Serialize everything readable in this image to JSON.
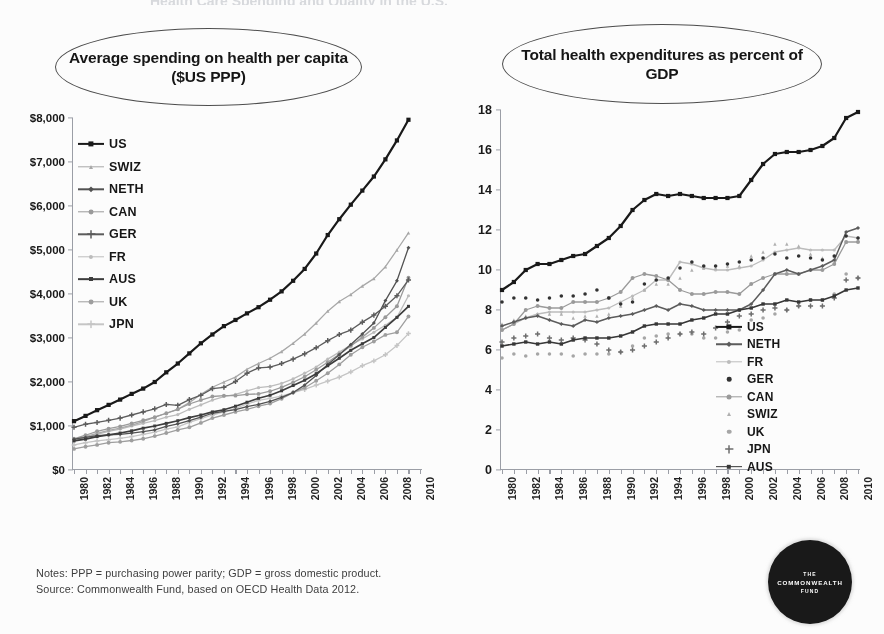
{
  "cropped_title": "Health Care Spending and Quality in the U.S.",
  "footer": {
    "notes": "Notes: PPP = purchasing power parity; GDP = gross domestic product.",
    "source": "Source: Commonwealth Fund, based on OECD Health Data 2012."
  },
  "logo": {
    "line1": "THE",
    "line2": "COMMONWEALTH",
    "line3": "FUND"
  },
  "chart_data": [
    {
      "id": "spending_per_capita",
      "type": "line",
      "title": "Average spending on health per capita ($US PPP)",
      "xlabel": "",
      "ylabel": "",
      "xlim": [
        1980,
        2010
      ],
      "ylim": [
        0,
        8000
      ],
      "yticks": [
        "$0",
        "$1,000",
        "$2,000",
        "$3,000",
        "$4,000",
        "$5,000",
        "$6,000",
        "$7,000",
        "$8,000"
      ],
      "ytick_values": [
        0,
        1000,
        2000,
        3000,
        4000,
        5000,
        6000,
        7000,
        8000
      ],
      "x": [
        1980,
        1981,
        1982,
        1983,
        1984,
        1985,
        1986,
        1987,
        1988,
        1989,
        1990,
        1991,
        1992,
        1993,
        1994,
        1995,
        1996,
        1997,
        1998,
        1999,
        2000,
        2001,
        2002,
        2003,
        2004,
        2005,
        2006,
        2007,
        2008,
        2009
      ],
      "xtick_labels": [
        "1980",
        "1982",
        "1984",
        "1986",
        "1988",
        "1990",
        "1992",
        "1994",
        "1996",
        "1998",
        "2000",
        "2002",
        "2004",
        "2006",
        "2008",
        "2010"
      ],
      "grid": false,
      "legend_position": "upper-left-inside",
      "series": [
        {
          "name": "US",
          "color": "#141414",
          "marker": "square",
          "size": 4.2,
          "width": 2.2,
          "values": [
            1110,
            1230,
            1360,
            1480,
            1600,
            1730,
            1850,
            2000,
            2220,
            2420,
            2650,
            2880,
            3080,
            3270,
            3410,
            3560,
            3700,
            3870,
            4060,
            4300,
            4570,
            4920,
            5340,
            5700,
            6030,
            6350,
            6670,
            7060,
            7490,
            7960
          ]
        },
        {
          "name": "SWIZ",
          "color": "#a8a8a8",
          "marker": "triangle",
          "size": 3.6,
          "width": 1.3,
          "values": [
            700,
            760,
            830,
            900,
            950,
            1020,
            1100,
            1200,
            1290,
            1380,
            1530,
            1720,
            1880,
            2000,
            2110,
            2290,
            2420,
            2540,
            2690,
            2880,
            3090,
            3340,
            3610,
            3830,
            3990,
            4180,
            4350,
            4620,
            5000,
            5390
          ]
        },
        {
          "name": "NETH",
          "color": "#4f4f4f",
          "marker": "diamond",
          "size": 3.4,
          "width": 1.3,
          "values": [
            700,
            740,
            780,
            800,
            810,
            840,
            870,
            910,
            990,
            1050,
            1120,
            1200,
            1290,
            1330,
            1370,
            1440,
            1490,
            1560,
            1650,
            1760,
            1930,
            2150,
            2400,
            2620,
            2850,
            3090,
            3340,
            3850,
            4300,
            5050
          ]
        },
        {
          "name": "CAN",
          "color": "#9a9a9a",
          "marker": "circle",
          "size": 3.9,
          "width": 1.3,
          "values": [
            710,
            790,
            880,
            940,
            990,
            1060,
            1130,
            1200,
            1290,
            1380,
            1500,
            1590,
            1670,
            1690,
            1690,
            1720,
            1730,
            1790,
            1880,
            1990,
            2120,
            2280,
            2450,
            2630,
            2820,
            3020,
            3230,
            3470,
            3720,
            4370
          ]
        },
        {
          "name": "GER",
          "color": "#5a5a5a",
          "marker": "cross",
          "size": 3.4,
          "width": 1.3,
          "values": [
            970,
            1040,
            1080,
            1130,
            1180,
            1250,
            1320,
            1390,
            1490,
            1470,
            1600,
            1700,
            1850,
            1880,
            2010,
            2200,
            2320,
            2340,
            2420,
            2520,
            2640,
            2780,
            2940,
            3080,
            3180,
            3360,
            3520,
            3720,
            3960,
            4320
          ]
        },
        {
          "name": "FR",
          "color": "#bdbdbd",
          "marker": "dot",
          "size": 3.2,
          "width": 1.3,
          "values": [
            670,
            740,
            810,
            880,
            930,
            1000,
            1060,
            1120,
            1200,
            1260,
            1380,
            1480,
            1590,
            1670,
            1720,
            1800,
            1870,
            1900,
            1970,
            2070,
            2200,
            2340,
            2520,
            2680,
            2840,
            2980,
            3130,
            3290,
            3470,
            3960
          ]
        },
        {
          "name": "AUS",
          "color": "#3a3a3a",
          "marker": "square",
          "size": 3.0,
          "width": 1.7,
          "values": [
            660,
            700,
            760,
            800,
            840,
            890,
            950,
            1000,
            1060,
            1120,
            1190,
            1250,
            1320,
            1370,
            1450,
            1540,
            1630,
            1700,
            1800,
            1920,
            2040,
            2190,
            2370,
            2540,
            2720,
            2870,
            3010,
            3240,
            3470,
            3720
          ]
        },
        {
          "name": "UK",
          "color": "#9e9e9e",
          "marker": "circle",
          "size": 3.9,
          "width": 1.3,
          "values": [
            480,
            530,
            570,
            620,
            640,
            670,
            710,
            770,
            840,
            910,
            970,
            1070,
            1180,
            1250,
            1320,
            1380,
            1450,
            1510,
            1620,
            1760,
            1870,
            2030,
            2200,
            2400,
            2620,
            2790,
            2920,
            3070,
            3130,
            3490
          ]
        },
        {
          "name": "JPN",
          "color": "#c6c6c6",
          "marker": "plus",
          "size": 3.2,
          "width": 1.3,
          "values": [
            570,
            620,
            660,
            690,
            720,
            760,
            810,
            860,
            930,
            980,
            1080,
            1170,
            1250,
            1320,
            1400,
            1500,
            1580,
            1630,
            1680,
            1760,
            1830,
            1930,
            2020,
            2110,
            2230,
            2370,
            2480,
            2620,
            2830,
            3100
          ]
        }
      ]
    },
    {
      "id": "expenditures_pct_gdp",
      "type": "line",
      "title": "Total health expenditures as percent of GDP",
      "xlabel": "",
      "ylabel": "",
      "xlim": [
        1980,
        2010
      ],
      "ylim": [
        0,
        18
      ],
      "yticks": [
        "0",
        "2",
        "4",
        "6",
        "8",
        "10",
        "12",
        "14",
        "16",
        "18"
      ],
      "ytick_values": [
        0,
        2,
        4,
        6,
        8,
        10,
        12,
        14,
        16,
        18
      ],
      "x": [
        1980,
        1981,
        1982,
        1983,
        1984,
        1985,
        1986,
        1987,
        1988,
        1989,
        1990,
        1991,
        1992,
        1993,
        1994,
        1995,
        1996,
        1997,
        1998,
        1999,
        2000,
        2001,
        2002,
        2003,
        2004,
        2005,
        2006,
        2007,
        2008,
        2009,
        2010
      ],
      "xtick_labels": [
        "1980",
        "1982",
        "1984",
        "1986",
        "1988",
        "1990",
        "1992",
        "1994",
        "1996",
        "1998",
        "2000",
        "2002",
        "2004",
        "2006",
        "2008",
        "2010"
      ],
      "grid": false,
      "legend_position": "lower-right-inside",
      "series": [
        {
          "name": "US",
          "color": "#141414",
          "marker": "square",
          "size": 4.2,
          "width": 2.2,
          "values": [
            9.0,
            9.4,
            10.0,
            10.3,
            10.3,
            10.5,
            10.7,
            10.8,
            11.2,
            11.6,
            12.2,
            13.0,
            13.5,
            13.8,
            13.7,
            13.8,
            13.7,
            13.6,
            13.6,
            13.6,
            13.7,
            14.5,
            15.3,
            15.8,
            15.9,
            15.9,
            16.0,
            16.2,
            16.6,
            17.6,
            17.9
          ]
        },
        {
          "name": "NETH",
          "color": "#5a5a5a",
          "marker": "diamond",
          "size": 3.6,
          "width": 1.5,
          "values": [
            7.2,
            7.4,
            7.6,
            7.7,
            7.5,
            7.3,
            7.2,
            7.5,
            7.4,
            7.6,
            7.7,
            7.8,
            8.0,
            8.2,
            8.0,
            8.3,
            8.2,
            8.0,
            8.0,
            8.0,
            8.0,
            8.3,
            9.0,
            9.8,
            10.0,
            9.8,
            10.0,
            10.2,
            10.5,
            11.9,
            12.1
          ]
        },
        {
          "name": "FR",
          "color": "#bdbdbd",
          "marker": "dot",
          "size": 3.2,
          "width": 1.4,
          "values": [
            7.0,
            7.3,
            7.6,
            7.8,
            7.9,
            7.9,
            7.9,
            7.9,
            8.0,
            8.1,
            8.4,
            8.7,
            9.0,
            9.5,
            9.5,
            10.4,
            10.3,
            10.1,
            10.0,
            10.0,
            10.1,
            10.2,
            10.5,
            10.9,
            11.0,
            11.1,
            11.0,
            11.0,
            11.0,
            11.7,
            11.6
          ]
        },
        {
          "name": "GER",
          "color": "#2e2e2e",
          "marker": "dot",
          "size": 3.6,
          "width": 0,
          "values": [
            8.4,
            8.6,
            8.6,
            8.5,
            8.6,
            8.7,
            8.7,
            8.8,
            9.0,
            8.6,
            8.3,
            8.4,
            9.3,
            9.5,
            9.6,
            10.1,
            10.4,
            10.2,
            10.2,
            10.3,
            10.4,
            10.5,
            10.6,
            10.8,
            10.6,
            10.7,
            10.6,
            10.5,
            10.7,
            11.7,
            11.6
          ]
        },
        {
          "name": "CAN",
          "color": "#9a9a9a",
          "marker": "circle",
          "size": 4.0,
          "width": 1.3,
          "values": [
            7.0,
            7.3,
            8.0,
            8.2,
            8.1,
            8.1,
            8.4,
            8.4,
            8.4,
            8.6,
            8.9,
            9.6,
            9.8,
            9.7,
            9.5,
            9.0,
            8.8,
            8.8,
            8.9,
            8.9,
            8.8,
            9.3,
            9.6,
            9.8,
            9.8,
            9.8,
            10.0,
            10.0,
            10.3,
            11.4,
            11.4
          ]
        },
        {
          "name": "SWIZ",
          "color": "#b0b0b0",
          "marker": "triangle",
          "size": 3.6,
          "width": 0,
          "values": [
            7.3,
            7.5,
            7.7,
            7.8,
            7.8,
            7.8,
            7.6,
            7.7,
            7.7,
            7.8,
            8.2,
            8.6,
            9.0,
            9.3,
            9.3,
            9.6,
            10.0,
            10.1,
            10.1,
            10.2,
            10.2,
            10.7,
            10.9,
            11.3,
            11.3,
            11.2,
            10.8,
            10.6,
            10.7,
            11.4,
            11.5
          ]
        },
        {
          "name": "UK",
          "color": "#a6a6a6",
          "marker": "circle",
          "size": 3.6,
          "width": 0,
          "values": [
            5.6,
            5.8,
            5.7,
            5.8,
            5.8,
            5.8,
            5.7,
            5.8,
            5.8,
            5.8,
            5.9,
            6.2,
            6.6,
            6.7,
            6.8,
            6.8,
            6.8,
            6.6,
            6.6,
            6.9,
            7.0,
            7.5,
            7.6,
            7.8,
            8.0,
            8.2,
            8.5,
            8.5,
            8.8,
            9.8,
            9.6
          ]
        },
        {
          "name": "JPN",
          "color": "#6b6b6b",
          "marker": "plus",
          "size": 3.4,
          "width": 0,
          "values": [
            6.4,
            6.6,
            6.7,
            6.8,
            6.6,
            6.5,
            6.6,
            6.5,
            6.3,
            6.0,
            5.9,
            6.0,
            6.2,
            6.4,
            6.6,
            6.8,
            6.9,
            6.8,
            7.1,
            7.4,
            7.7,
            7.8,
            8.0,
            8.1,
            8.0,
            8.2,
            8.2,
            8.2,
            8.6,
            9.5,
            9.6
          ]
        },
        {
          "name": "AUS",
          "color": "#333333",
          "marker": "square",
          "size": 3.4,
          "width": 1.7,
          "values": [
            6.2,
            6.3,
            6.4,
            6.3,
            6.4,
            6.3,
            6.5,
            6.6,
            6.6,
            6.6,
            6.7,
            6.9,
            7.2,
            7.3,
            7.3,
            7.3,
            7.5,
            7.6,
            7.8,
            7.8,
            8.0,
            8.1,
            8.3,
            8.3,
            8.5,
            8.4,
            8.5,
            8.5,
            8.7,
            9.0,
            9.1
          ]
        }
      ]
    }
  ]
}
